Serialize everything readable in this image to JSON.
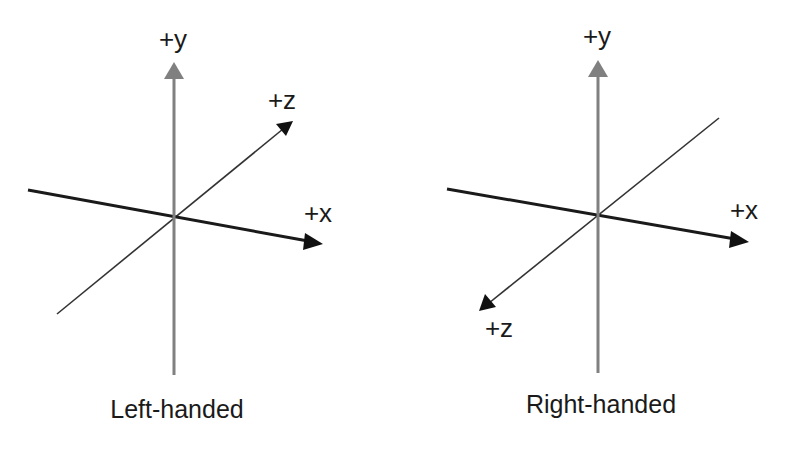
{
  "figure": {
    "colors": {
      "background": "#ffffff",
      "y_axis": "#808080",
      "x_axis": "#1a1a1a",
      "z_axis": "#333333",
      "arrowhead_dark": "#111111",
      "text": "#1a1a1a"
    },
    "panels": [
      {
        "id": "left",
        "caption": "Left-handed",
        "labels": {
          "y": "+y",
          "x": "+x",
          "z": "+z"
        },
        "z_direction": "into-screen (up-right)"
      },
      {
        "id": "right",
        "caption": "Right-handed",
        "labels": {
          "y": "+y",
          "x": "+x",
          "z": "+z"
        },
        "z_direction": "out-of-screen (down-left)"
      }
    ]
  }
}
